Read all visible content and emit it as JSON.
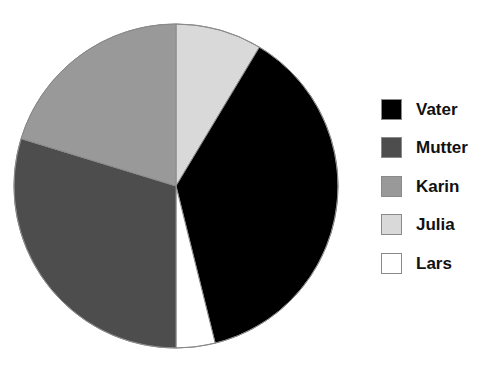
{
  "top_artifact_text": "",
  "chart_data": {
    "type": "pie",
    "title": "",
    "start_angle_deg": 0,
    "direction": "clockwise",
    "center": {
      "x": 176,
      "y": 186
    },
    "radius": 162,
    "legend_position": "right",
    "categories": [
      "Vater",
      "Mutter",
      "Karin",
      "Julia",
      "Lars"
    ],
    "values": [
      37.5,
      29.8,
      20.2,
      8.6,
      3.9
    ],
    "unit": "%",
    "colors": {
      "Vater": "#000000",
      "Mutter": "#4d4d4d",
      "Karin": "#999999",
      "Julia": "#d9d9d9",
      "Lars": "#ffffff"
    },
    "slice_order_clockwise_from_top": [
      "Julia",
      "Vater",
      "Lars",
      "Mutter",
      "Karin"
    ],
    "slice_boundaries_deg": [
      0,
      31,
      166,
      180,
      287,
      360
    ],
    "slices": [
      {
        "label": "Julia",
        "value": 8.6,
        "color": "#d9d9d9",
        "start_deg": 0,
        "end_deg": 31
      },
      {
        "label": "Vater",
        "value": 37.5,
        "color": "#000000",
        "start_deg": 31,
        "end_deg": 166
      },
      {
        "label": "Lars",
        "value": 3.9,
        "color": "#ffffff",
        "start_deg": 166,
        "end_deg": 180
      },
      {
        "label": "Mutter",
        "value": 29.8,
        "color": "#4d4d4d",
        "start_deg": 180,
        "end_deg": 287
      },
      {
        "label": "Karin",
        "value": 20.2,
        "color": "#999999",
        "start_deg": 287,
        "end_deg": 360
      }
    ],
    "stroke_color": "#8a8a8a",
    "background": "#ffffff"
  },
  "legend": {
    "items": [
      {
        "label": "Vater",
        "color": "#000000"
      },
      {
        "label": "Mutter",
        "color": "#4d4d4d"
      },
      {
        "label": "Karin",
        "color": "#999999"
      },
      {
        "label": "Julia",
        "color": "#d9d9d9"
      },
      {
        "label": "Lars",
        "color": "#ffffff"
      }
    ]
  }
}
